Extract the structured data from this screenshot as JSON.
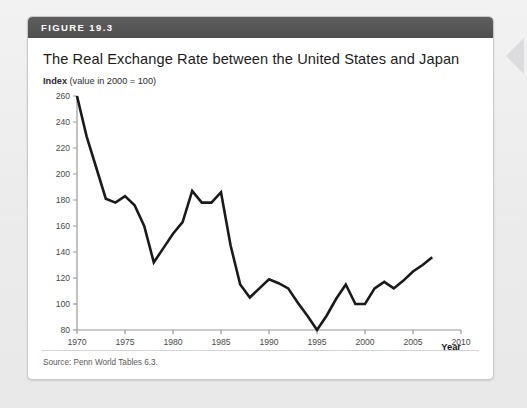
{
  "figure": {
    "number_label": "FIGURE 19.3",
    "title": "The Real Exchange Rate between the United States and Japan",
    "axis_note_bold": "Index",
    "axis_note_rest": " (value in 2000 = 100)",
    "source": "Source: Penn World Tables 6.3.",
    "header_color": "#575757",
    "line_color": "#1a1a1a",
    "axis_color": "#9a9a9a",
    "tick_text_color": "#4a4a4a"
  },
  "chart_data": {
    "type": "line",
    "title": "The Real Exchange Rate between the United States and Japan",
    "subtitle": "Index (value in 2000 = 100)",
    "xlabel": "Year",
    "ylabel": "Index",
    "xlim": [
      1970,
      2010
    ],
    "ylim": [
      80,
      260
    ],
    "xticks": [
      1970,
      1975,
      1980,
      1985,
      1990,
      1995,
      2000,
      2005,
      2010
    ],
    "yticks": [
      80,
      100,
      120,
      140,
      160,
      180,
      200,
      220,
      240,
      260
    ],
    "grid": false,
    "legend": "none",
    "series": [
      {
        "name": "Real exchange rate index (US/Japan)",
        "x": [
          1970,
          1971,
          1972,
          1973,
          1974,
          1975,
          1976,
          1977,
          1978,
          1979,
          1980,
          1981,
          1982,
          1983,
          1984,
          1985,
          1986,
          1987,
          1988,
          1989,
          1990,
          1991,
          1992,
          1993,
          1994,
          1995,
          1996,
          1997,
          1998,
          1999,
          2000,
          2001,
          2002,
          2003,
          2004,
          2005,
          2006,
          2007
        ],
        "values": [
          260,
          229,
          205,
          181,
          178,
          183,
          176,
          160,
          132,
          143,
          154,
          163,
          187,
          178,
          178,
          186,
          145,
          115,
          105,
          112,
          119,
          116,
          112,
          101,
          91,
          80,
          91,
          104,
          115,
          100,
          100,
          112,
          117,
          112,
          118,
          125,
          130,
          136
        ]
      }
    ],
    "source": "Penn World Tables 6.3."
  }
}
